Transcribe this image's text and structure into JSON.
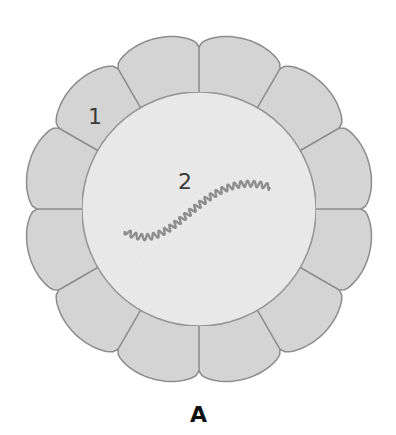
{
  "diagram": {
    "type": "cross-section",
    "structure": "ring of 12 epithelial cells surrounding a central lumen",
    "labels": [
      {
        "id": "1",
        "text": "1",
        "target": "cell in outer ring"
      },
      {
        "id": "2",
        "text": "2",
        "target": "lumen with coiled fiber"
      }
    ],
    "caption": "A",
    "cell_count": 12,
    "colors": {
      "cell_fill": "#d4d4d4",
      "cell_stroke": "#8c8c8c",
      "lumen_fill": "#ececec",
      "fiber": "#8e8e8e",
      "label": "#3a3a3a",
      "caption": "#111111"
    }
  }
}
